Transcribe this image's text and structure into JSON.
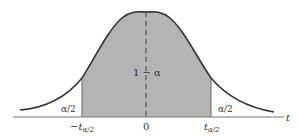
{
  "diagram": {
    "center_label": "1 − α",
    "left_tail_label": "α/2",
    "right_tail_label": "α/2",
    "axis_label": "t",
    "ticks": {
      "left": {
        "main": "−t",
        "sub": "α/2"
      },
      "center": "0",
      "right": {
        "main": "t",
        "sub": "α/2"
      }
    },
    "colors": {
      "shaded_region": "#b4b4b4",
      "curve": "#333333",
      "axis": "#777777",
      "background": "#ffffff"
    }
  }
}
